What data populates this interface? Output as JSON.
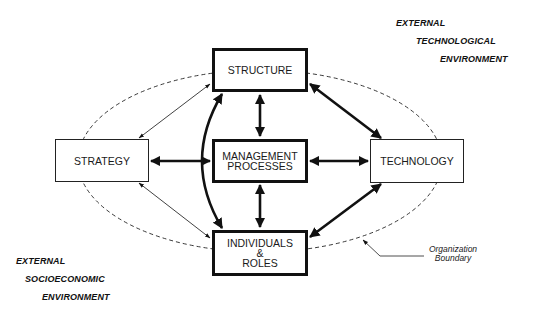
{
  "diagram": {
    "boxes": {
      "structure": "STRUCTURE",
      "strategy": "STRATEGY",
      "management_processes_line1": "MANAGEMENT",
      "management_processes_line2": "PROCESSES",
      "technology": "TECHNOLOGY",
      "individuals_line1": "INDIVIDUALS",
      "individuals_line2": "&",
      "individuals_line3": "ROLES"
    },
    "external_technological": {
      "line1": "EXTERNAL",
      "line2": "TECHNOLOGICAL",
      "line3": "ENVIRONMENT"
    },
    "external_socioeconomic": {
      "line1": "EXTERNAL",
      "line2": "SOCIOECONOMIC",
      "line3": "ENVIRONMENT"
    },
    "boundary_label": {
      "line1": "Organization",
      "line2": "Boundary"
    },
    "connections": [
      {
        "from": "STRUCTURE",
        "to": "MANAGEMENT PROCESSES",
        "weight": "thick",
        "direction": "bidirectional"
      },
      {
        "from": "MANAGEMENT PROCESSES",
        "to": "INDIVIDUALS & ROLES",
        "weight": "thick",
        "direction": "bidirectional"
      },
      {
        "from": "STRATEGY",
        "to": "MANAGEMENT PROCESSES",
        "weight": "thick",
        "direction": "bidirectional"
      },
      {
        "from": "MANAGEMENT PROCESSES",
        "to": "TECHNOLOGY",
        "weight": "thick",
        "direction": "bidirectional"
      },
      {
        "from": "STRUCTURE",
        "to": "TECHNOLOGY",
        "weight": "thick",
        "direction": "bidirectional"
      },
      {
        "from": "TECHNOLOGY",
        "to": "INDIVIDUALS & ROLES",
        "weight": "thick",
        "direction": "bidirectional"
      },
      {
        "from": "STRUCTURE",
        "to": "INDIVIDUALS & ROLES",
        "weight": "thick",
        "direction": "bidirectional",
        "shape": "curved"
      },
      {
        "from": "STRATEGY",
        "to": "STRUCTURE",
        "weight": "thin",
        "direction": "bidirectional"
      },
      {
        "from": "STRATEGY",
        "to": "INDIVIDUALS & ROLES",
        "weight": "thin",
        "direction": "bidirectional"
      }
    ]
  }
}
